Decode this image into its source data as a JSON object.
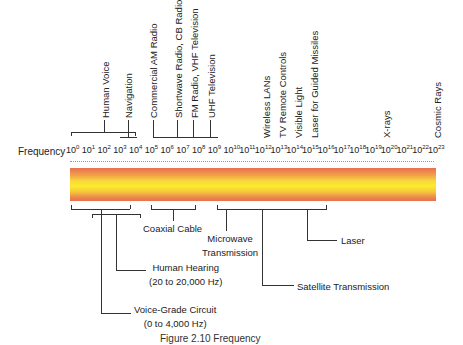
{
  "axis": {
    "title": "Frequency",
    "ticks": [
      "0",
      "1",
      "2",
      "3",
      "4",
      "5",
      "6",
      "7",
      "8",
      "9",
      "10",
      "11",
      "12",
      "13",
      "14",
      "15",
      "16",
      "17",
      "18",
      "19",
      "20",
      "21",
      "22",
      "23"
    ],
    "base": "10"
  },
  "top_labels": [
    {
      "id": "human-voice",
      "text": "Human Voice"
    },
    {
      "id": "navigation",
      "text": "Navigation"
    },
    {
      "id": "commercial-am",
      "text": "Commercial AM Radio"
    },
    {
      "id": "shortwave",
      "text": "Shortwave Radio, CB Radio"
    },
    {
      "id": "fm-vhf",
      "text": "FM Radio, VHF Television"
    },
    {
      "id": "uhf",
      "text": "UHF Television"
    },
    {
      "id": "wireless-lans",
      "text": "Wireless LANs"
    },
    {
      "id": "tv-remote",
      "text": "TV Remote Controls"
    },
    {
      "id": "visible-light",
      "text": "Visible Light"
    },
    {
      "id": "laser-missiles",
      "text": "Laser for Guided Missiles"
    },
    {
      "id": "x-rays",
      "text": "X-rays"
    },
    {
      "id": "cosmic-rays",
      "text": "Cosmic Rays"
    }
  ],
  "bottom_labels": {
    "coaxial": "Coaxial Cable",
    "microwave_1": "Microwave",
    "microwave_2": "Transmission",
    "laser": "Laser",
    "hearing_1": "Human Hearing",
    "hearing_2": "(20 to 20,000 Hz)",
    "satellite": "Satellite Transmission",
    "voice_grade_1": "Voice-Grade Circuit",
    "voice_grade_2": "(0 to 4,000 Hz)"
  },
  "caption": "Figure 2.10  Frequency",
  "colors": {
    "band_edge": "#e8704f",
    "band_center": "#fbeb2c",
    "band_mid": "#f0a24a"
  }
}
